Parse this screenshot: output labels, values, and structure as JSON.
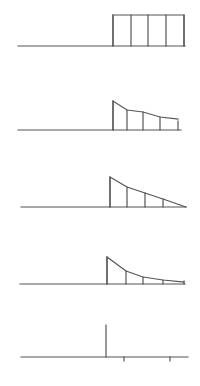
{
  "diagram": {
    "stroke_color": "#555555",
    "background": "#ffffff",
    "panels": [
      {
        "id": "panel-1",
        "name": "rectangular-pulse-panel",
        "baseline": {
          "x1": 18,
          "x2": 185,
          "y": 46
        },
        "envelope": [
          [
            113,
            46
          ],
          [
            113,
            15
          ],
          [
            184,
            15
          ],
          [
            184,
            46
          ]
        ],
        "stems": [
          {
            "x": 113,
            "y_top": 15
          },
          {
            "x": 131,
            "y_top": 15
          },
          {
            "x": 148,
            "y_top": 15
          },
          {
            "x": 166,
            "y_top": 15
          },
          {
            "x": 184,
            "y_top": 15
          }
        ],
        "ticks": []
      },
      {
        "id": "panel-2",
        "name": "slow-decay-panel",
        "baseline": {
          "x1": 18,
          "x2": 181,
          "y": 130
        },
        "envelope": [
          [
            113,
            130
          ],
          [
            113,
            101
          ],
          [
            127,
            110
          ],
          [
            143,
            112
          ],
          [
            160,
            117
          ],
          [
            178,
            119
          ]
        ],
        "stems": [
          {
            "x": 113,
            "y_top": 101
          },
          {
            "x": 127,
            "y_top": 110
          },
          {
            "x": 143,
            "y_top": 112
          },
          {
            "x": 160,
            "y_top": 117
          },
          {
            "x": 178,
            "y_top": 121
          }
        ],
        "ticks": []
      },
      {
        "id": "panel-3",
        "name": "linear-decay-panel",
        "baseline": {
          "x1": 21,
          "x2": 186,
          "y": 207
        },
        "envelope": [
          [
            110,
            207
          ],
          [
            110,
            177
          ],
          [
            127,
            187
          ],
          [
            145,
            193
          ],
          [
            163,
            199
          ],
          [
            186,
            207
          ]
        ],
        "stems": [
          {
            "x": 110,
            "y_top": 177
          },
          {
            "x": 127,
            "y_top": 187
          },
          {
            "x": 145,
            "y_top": 193
          },
          {
            "x": 163,
            "y_top": 199
          }
        ],
        "ticks": []
      },
      {
        "id": "panel-4",
        "name": "fast-decay-panel",
        "baseline": {
          "x1": 20,
          "x2": 185,
          "y": 284
        },
        "envelope": [
          [
            107,
            284
          ],
          [
            107,
            257
          ],
          [
            126,
            271
          ],
          [
            143,
            277
          ],
          [
            163,
            280
          ],
          [
            184,
            282
          ]
        ],
        "stems": [
          {
            "x": 107,
            "y_top": 257
          },
          {
            "x": 126,
            "y_top": 271
          },
          {
            "x": 143,
            "y_top": 277
          },
          {
            "x": 163,
            "y_top": 280
          },
          {
            "x": 184,
            "y_top": 281
          }
        ],
        "ticks": []
      },
      {
        "id": "panel-5",
        "name": "impulse-panel",
        "baseline": {
          "x1": 21,
          "x2": 188,
          "y": 357
        },
        "envelope": [],
        "stems": [
          {
            "x": 106,
            "y_top": 325
          }
        ],
        "ticks": [
          {
            "x": 124,
            "y1": 357,
            "y2": 361
          },
          {
            "x": 170,
            "y1": 357,
            "y2": 361
          }
        ]
      }
    ]
  }
}
